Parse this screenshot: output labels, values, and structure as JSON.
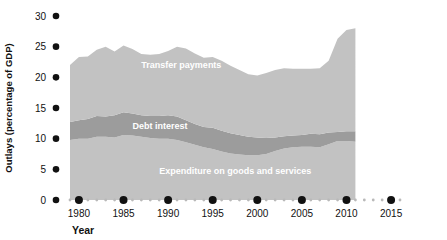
{
  "chart_data": {
    "type": "area",
    "stacked": true,
    "title": "",
    "xlabel": "Year",
    "ylabel": "Outlays (percentage of GDP)",
    "xlim": [
      1979,
      2016
    ],
    "ylim": [
      0,
      30
    ],
    "grid": false,
    "legend_position": "inline-annotations",
    "x_ticks": [
      "1980",
      "1985",
      "1990",
      "1995",
      "2000",
      "2005",
      "2010",
      "2015"
    ],
    "x_tick_values": [
      1980,
      1985,
      1990,
      1995,
      2000,
      2005,
      2010,
      2015
    ],
    "y_ticks": [
      "0",
      "5",
      "10",
      "15",
      "20",
      "25",
      "30"
    ],
    "y_tick_values": [
      0,
      5,
      10,
      15,
      20,
      25,
      30
    ],
    "x": [
      1979,
      1980,
      1981,
      1982,
      1983,
      1984,
      1985,
      1986,
      1987,
      1988,
      1989,
      1990,
      1991,
      1992,
      1993,
      1994,
      1995,
      1996,
      1997,
      1998,
      1999,
      2000,
      2001,
      2002,
      2003,
      2004,
      2005,
      2006,
      2007,
      2008,
      2009,
      2010,
      2011
    ],
    "series": [
      {
        "name": "Expenditure on goods and services",
        "color": "#c2c2c2",
        "values": [
          9.8,
          10.0,
          10.0,
          10.3,
          10.3,
          10.2,
          10.6,
          10.5,
          10.3,
          10.1,
          10.0,
          10.0,
          9.8,
          9.4,
          9.0,
          8.6,
          8.3,
          7.9,
          7.6,
          7.4,
          7.3,
          7.3,
          7.5,
          8.0,
          8.4,
          8.6,
          8.7,
          8.7,
          8.6,
          9.1,
          9.6,
          9.6,
          9.5
        ]
      },
      {
        "name": "Debt interest",
        "color": "#9c9c9c",
        "values": [
          2.9,
          3.0,
          3.2,
          3.4,
          3.3,
          3.6,
          3.7,
          3.6,
          3.5,
          3.6,
          3.7,
          3.8,
          3.8,
          3.6,
          3.4,
          3.3,
          3.5,
          3.4,
          3.3,
          3.2,
          3.0,
          2.9,
          2.6,
          2.2,
          2.0,
          1.9,
          1.9,
          2.1,
          2.1,
          1.9,
          1.5,
          1.6,
          1.7
        ]
      },
      {
        "name": "Transfer payments",
        "color": "#c2c2c2",
        "values": [
          9.3,
          10.3,
          10.2,
          10.8,
          11.4,
          10.4,
          10.9,
          10.5,
          10.0,
          10.0,
          10.1,
          10.5,
          11.4,
          11.7,
          11.5,
          11.3,
          11.5,
          11.4,
          11.0,
          10.6,
          10.2,
          10.1,
          10.6,
          11.0,
          11.1,
          10.9,
          10.8,
          10.6,
          10.8,
          11.7,
          15.2,
          16.5,
          16.8
        ]
      }
    ],
    "annotations": [
      {
        "text": "Transfer payments",
        "x": 1987,
        "y": 21.5
      },
      {
        "text": "Debt interest",
        "x": 1986,
        "y": 11.6
      },
      {
        "text": "Expenditure on goods and services",
        "x": 1989,
        "y": 4.2
      }
    ]
  },
  "axis": {
    "y_title": "Outlays (percentage of GDP)",
    "x_title": "Year"
  }
}
